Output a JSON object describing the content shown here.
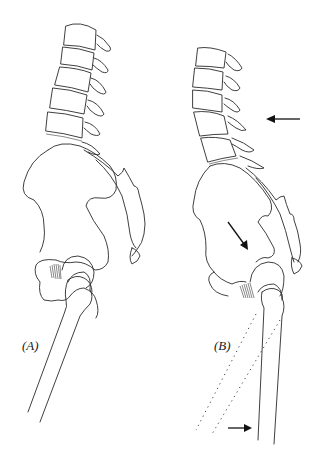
{
  "figure": {
    "panels": [
      {
        "id": "A",
        "label": "(A)",
        "arrows": []
      },
      {
        "id": "B",
        "label": "(B)",
        "arrows": [
          {
            "name": "lumbar-arrow",
            "direction": "left"
          },
          {
            "name": "pelvis-arrow",
            "direction": "down-right"
          },
          {
            "name": "femur-arrow",
            "direction": "right"
          }
        ],
        "has_dotted_femur_outline": true
      }
    ]
  }
}
